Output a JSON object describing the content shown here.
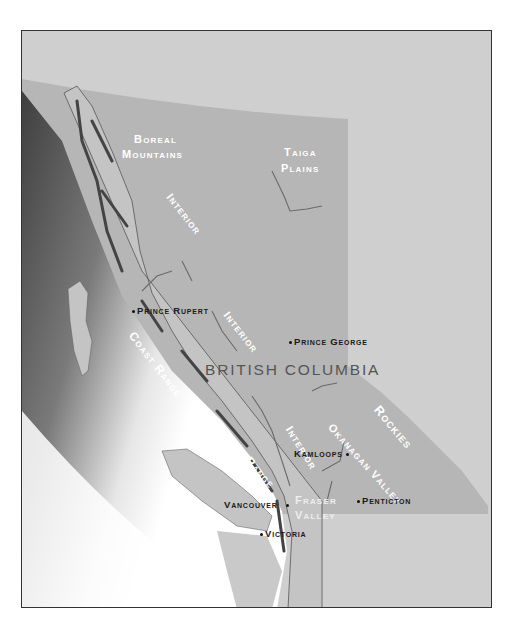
{
  "map": {
    "province_label": "BRITISH COLUMBIA",
    "colors": {
      "background": "#cfcfcf",
      "province": "#b6b6b6",
      "land": "#c9c9c9",
      "ocean_dark": "#4a4a4a",
      "ocean_light": "#ffffff",
      "frame_border": "#333333",
      "region_text": "#ffffff",
      "city_text": "#1a1a1a",
      "province_text": "#555555"
    },
    "regions": [
      {
        "id": "boreal",
        "line1": "Boreal",
        "line2": "Mountains"
      },
      {
        "id": "taiga",
        "line1": "Taiga",
        "line2": "Plains"
      },
      {
        "id": "interior-1",
        "label": "Interior"
      },
      {
        "id": "interior-2",
        "label": "Interior"
      },
      {
        "id": "interior-3",
        "label": "Interior"
      },
      {
        "id": "coast-range-1",
        "label": "Coast Range"
      },
      {
        "id": "coast-range-2",
        "label": "Coast Range"
      },
      {
        "id": "rockies",
        "label": "Rockies"
      },
      {
        "id": "okanagan",
        "label": "Okanagan Valley"
      },
      {
        "id": "fraser",
        "line1": "Fraser",
        "line2": "Valley"
      }
    ],
    "cities": [
      {
        "id": "prince-rupert",
        "name": "Prince Rupert"
      },
      {
        "id": "prince-george",
        "name": "Prince George"
      },
      {
        "id": "kamloops",
        "name": "Kamloops"
      },
      {
        "id": "vancouver",
        "name": "Vancouver"
      },
      {
        "id": "penticton",
        "name": "Penticton"
      },
      {
        "id": "victoria",
        "name": "Victoria"
      }
    ]
  }
}
